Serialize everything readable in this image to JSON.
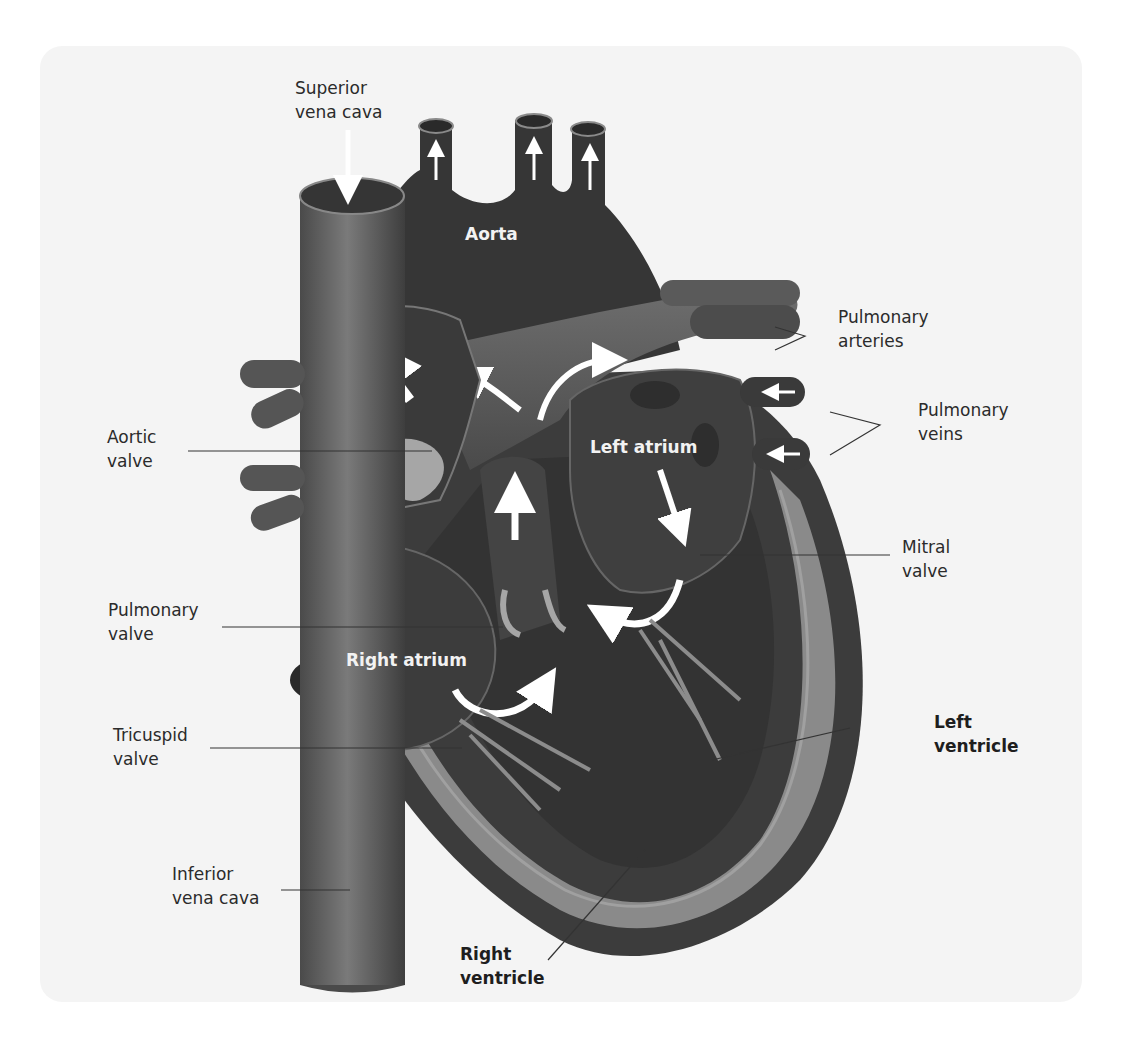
{
  "diagram": {
    "colors": {
      "background": "#f4f4f4",
      "tissue_dark": "#3a3a3a",
      "tissue_mid": "#5a5a5a",
      "tissue_light": "#8c8c8c",
      "valve": "#a6a6a6",
      "arrow": "#ffffff",
      "leader_line": "#333333"
    },
    "labels": {
      "superior_vena_cava": "Superior\nvena cava",
      "pulmonary_arteries": "Pulmonary\narteries",
      "pulmonary_veins": "Pulmonary\nveins",
      "aortic_valve": "Aortic\nvalve",
      "mitral_valve": "Mitral\nvalve",
      "pulmonary_valve": "Pulmonary\nvalve",
      "tricuspid_valve": "Tricuspid\nvalve",
      "left_ventricle": "Left\nventricle",
      "inferior_vena_cava": "Inferior\nvena cava",
      "right_ventricle": "Right\nventricle"
    },
    "inner_labels": {
      "aorta": "Aorta",
      "left_atrium": "Left atrium",
      "right_atrium": "Right atrium"
    }
  }
}
